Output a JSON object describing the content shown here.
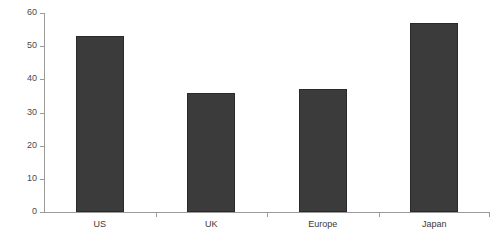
{
  "chart_data": {
    "type": "bar",
    "title": "",
    "xlabel": "",
    "ylabel": "",
    "categories": [
      "US",
      "UK",
      "Europe",
      "Japan"
    ],
    "values": [
      53,
      36,
      37,
      57
    ],
    "ylim": [
      0,
      60
    ],
    "ytick_step": 10,
    "yticks": [
      "0",
      "10",
      "20",
      "30",
      "40",
      "50",
      "60"
    ],
    "grid": false,
    "legend": null,
    "series": [
      {
        "name": "",
        "values": [
          53,
          36,
          37,
          57
        ]
      }
    ],
    "colors": {
      "bar_fill": "#3b3b3b",
      "bar_border": "#2a2a2a",
      "axis": "#9a9a9a",
      "tick_label": "#4a4a4a",
      "category_label": "#3a3a3a",
      "background": "#ffffff"
    }
  }
}
